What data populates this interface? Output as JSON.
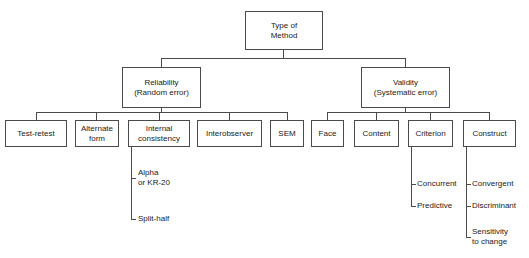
{
  "diagram": {
    "line_color": "#4a4a4a",
    "text_color": "#1a1a1a",
    "background": "#ffffff"
  },
  "root": {
    "line1": "Type of",
    "line2": "Method"
  },
  "branches": {
    "reliability": {
      "line1": "Reliability",
      "line2": "(Random error)"
    },
    "validity": {
      "line1": "Validity",
      "line2": "(Systematic error)"
    }
  },
  "reliability_children": [
    {
      "line1": "Test-retest",
      "line2": ""
    },
    {
      "line1": "Alternate",
      "line2": "form"
    },
    {
      "line1": "Internal",
      "line2": "consistency"
    },
    {
      "line1": "Interobserver",
      "line2": ""
    },
    {
      "line1": "SEM",
      "line2": ""
    }
  ],
  "validity_children": [
    {
      "line1": "Face",
      "line2": ""
    },
    {
      "line1": "Content",
      "line2": ""
    },
    {
      "line1": "Criterion",
      "line2": ""
    },
    {
      "line1": "Construct",
      "line2": ""
    }
  ],
  "internal_consistency_leaves": [
    {
      "line1": "Alpha",
      "line2": "or KR-20"
    },
    {
      "line1": "Split-half",
      "line2": ""
    }
  ],
  "criterion_leaves": [
    {
      "line1": "Concurrent",
      "line2": ""
    },
    {
      "line1": "Predictive",
      "line2": ""
    }
  ],
  "construct_leaves": [
    {
      "line1": "Convergent",
      "line2": ""
    },
    {
      "line1": "Discriminant",
      "line2": ""
    },
    {
      "line1": "Sensitivity",
      "line2": "to change"
    }
  ]
}
